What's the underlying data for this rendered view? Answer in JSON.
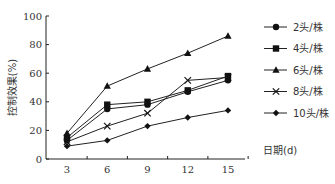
{
  "chart_data": {
    "type": "line",
    "title": "",
    "xlabel": "日期(d)",
    "ylabel": "控制效果(%)",
    "x": [
      3,
      6,
      9,
      12,
      15
    ],
    "ylim": [
      0,
      100
    ],
    "yticks": [
      0,
      20,
      40,
      60,
      80,
      100
    ],
    "xticks": [
      3,
      6,
      9,
      12,
      15
    ],
    "grid": false,
    "legend_position": "right",
    "series": [
      {
        "name": "2头/株",
        "marker": "circle",
        "values": [
          13,
          35,
          38,
          47,
          55
        ]
      },
      {
        "name": "4头/株",
        "marker": "square",
        "values": [
          15,
          38,
          40,
          48,
          58
        ]
      },
      {
        "name": "6头/株",
        "marker": "triangle",
        "values": [
          18,
          51,
          63,
          74,
          86
        ]
      },
      {
        "name": "8头/株",
        "marker": "x",
        "values": [
          12,
          23,
          32,
          55,
          57
        ]
      },
      {
        "name": "10头/株",
        "marker": "diamond",
        "values": [
          9,
          13,
          23,
          29,
          34
        ]
      }
    ]
  }
}
